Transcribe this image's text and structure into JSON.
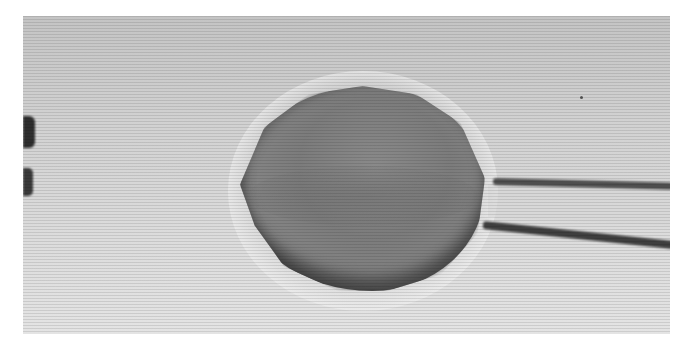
{
  "image": {
    "description": "Grayscale light micrograph of a round cell held at the tip of a glass micropipette",
    "subjects": [
      "cell",
      "micropipette",
      "partial-object-left-edge"
    ],
    "colors": {
      "background": "#d4d4d4",
      "cell": "#7e7e7e",
      "pipette_wall": "#444444",
      "page": "#ffffff"
    }
  }
}
